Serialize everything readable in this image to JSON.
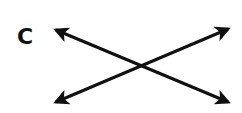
{
  "panel": {
    "label": "C"
  },
  "diagram": {
    "stroke_color": "#111111",
    "arrows": [
      {
        "name": "arrow-topleft-bottomright",
        "from": [
          56,
          30
        ],
        "to": [
          228,
          102
        ],
        "heads": "both"
      },
      {
        "name": "arrow-bottomleft-topright",
        "from": [
          56,
          102
        ],
        "to": [
          228,
          29
        ],
        "heads": "both"
      }
    ],
    "crossing_point": [
      142,
      66
    ]
  }
}
